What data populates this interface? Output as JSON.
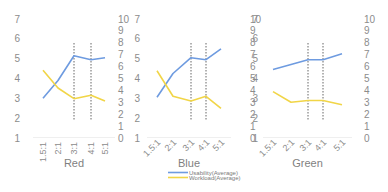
{
  "chart_data": {
    "type": "line",
    "layout": "three small-multiple line panels with dual y-axes, shared legend below middle panel",
    "categories": [
      "1.5:1",
      "2:1",
      "3:1",
      "4:1",
      "5:1"
    ],
    "left_axis": {
      "label": "",
      "ylim": [
        1,
        7
      ],
      "ticks": [
        "1",
        "2",
        "3",
        "4",
        "5",
        "6",
        "7"
      ]
    },
    "right_axis": {
      "label": "",
      "ylim": [
        0,
        10
      ],
      "ticks": [
        "0",
        "1",
        "2",
        "3",
        "4",
        "5",
        "6",
        "7",
        "8",
        "9",
        "10"
      ]
    },
    "grid": false,
    "legend": {
      "position": "bottom-center",
      "entries": [
        {
          "name": "Usability(Average)",
          "color": "#6e9be0",
          "axis": "left"
        },
        {
          "name": "Workload(Average)",
          "color": "#f1d547",
          "axis": "right"
        }
      ]
    },
    "reference_lines": {
      "style": "dotted vertical",
      "at_categories": [
        "3:1",
        "4:1"
      ]
    },
    "panels": [
      {
        "title": "Red",
        "xtick_rotation": 90,
        "series": [
          {
            "name": "Usability(Average)",
            "axis": "left",
            "values": [
              3.0,
              3.9,
              5.15,
              4.95,
              5.05
            ]
          },
          {
            "name": "Workload(Average)",
            "axis": "right",
            "values": [
              5.7,
              4.2,
              3.3,
              3.6,
              3.1
            ]
          }
        ]
      },
      {
        "title": "Blue",
        "xtick_rotation": 45,
        "series": [
          {
            "name": "Usability(Average)",
            "axis": "left",
            "values": [
              3.05,
              4.25,
              5.05,
              4.95,
              5.5
            ]
          },
          {
            "name": "Workload(Average)",
            "axis": "right",
            "values": [
              5.65,
              3.5,
              3.1,
              3.5,
              2.5
            ]
          }
        ]
      },
      {
        "title": "Green",
        "xtick_rotation": 45,
        "series": [
          {
            "name": "Usability(Average)",
            "axis": "left",
            "values": [
              4.45,
              4.7,
              4.95,
              4.95,
              5.25
            ]
          },
          {
            "name": "Workload(Average)",
            "axis": "right",
            "values": [
              3.9,
              3.0,
              3.15,
              3.15,
              2.8
            ]
          }
        ]
      }
    ]
  },
  "ui": {
    "panel_titles": [
      "Red",
      "Blue",
      "Green"
    ],
    "legend_labels": [
      "Usability(Average)",
      "Workload(Average)"
    ]
  }
}
